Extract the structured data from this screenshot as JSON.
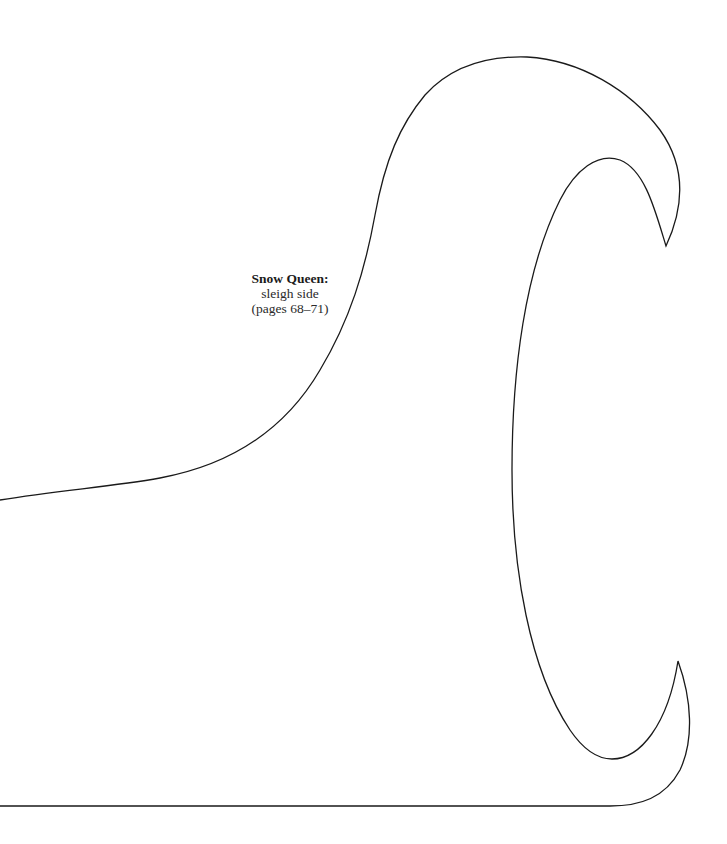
{
  "page": {
    "background": "#ffffff",
    "stroke_color": "#1a1a1a"
  },
  "label": {
    "title": "Snow Queen:",
    "subtitle": "sleigh side",
    "pages": "(pages 68–71)"
  },
  "shape": {
    "name": "sleigh side template outline",
    "icon": "sleigh-side-outline-shape"
  }
}
